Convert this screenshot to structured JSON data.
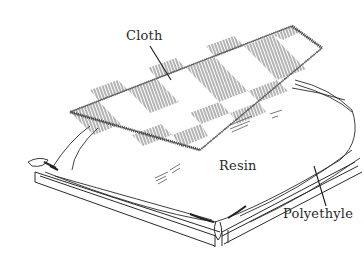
{
  "figure": {
    "labels": {
      "cloth": "Cloth",
      "resin": "Resin",
      "polyethylene": "Polyethyle"
    },
    "colors": {
      "line": "#2a2a2a",
      "hatch": "#6a6a6a",
      "background": "#ffffff"
    }
  }
}
